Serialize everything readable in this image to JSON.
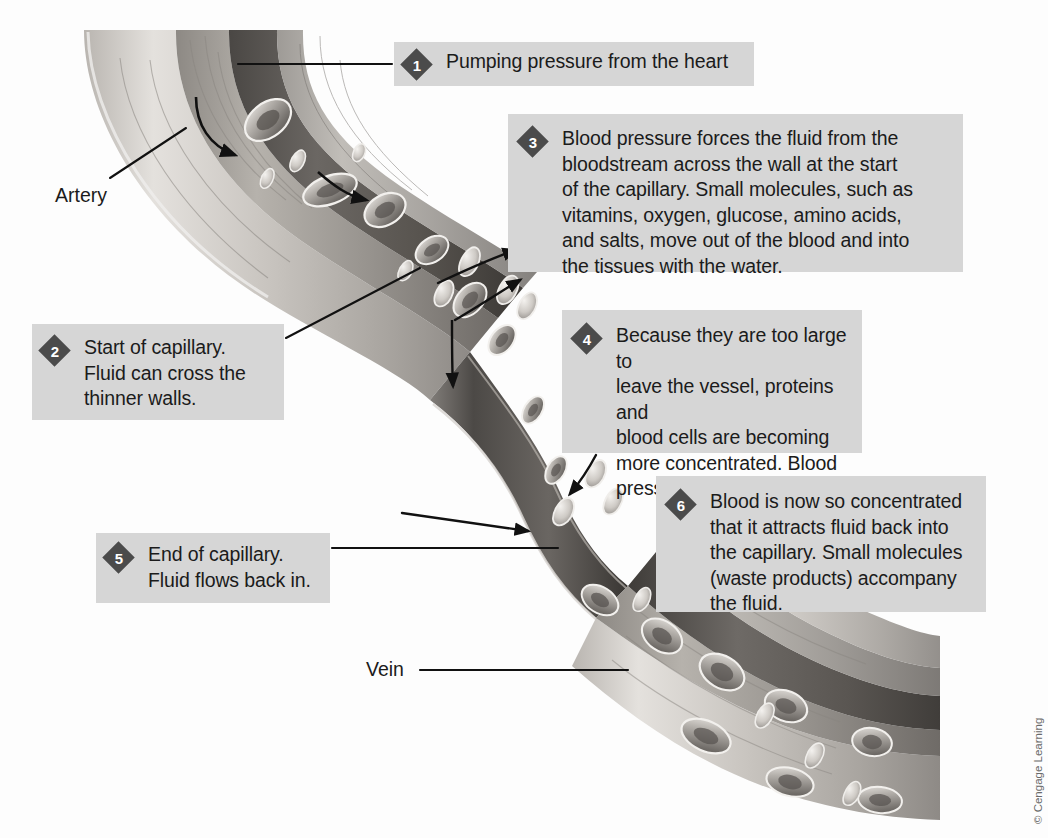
{
  "figure": {
    "copyright": "© Cengage Learning"
  },
  "labels": {
    "artery": "Artery",
    "vein": "Vein"
  },
  "callouts": [
    {
      "number": "1",
      "text": "Pumping pressure from the heart"
    },
    {
      "number": "2",
      "text": "Start of capillary.\nFluid can cross the\nthinner walls."
    },
    {
      "number": "3",
      "text": "Blood pressure forces the fluid from the\nbloodstream across the wall at the start\nof the capillary. Small molecules, such as\nvitamins, oxygen, glucose, amino acids,\nand salts, move out of the blood and into\nthe tissues with the water."
    },
    {
      "number": "4",
      "text": "Because they are too large to\nleave the vessel, proteins and\nblood cells are becoming\nmore concentrated. Blood\npressure is decreasing."
    },
    {
      "number": "5",
      "text": "End of capillary.\nFluid flows back in."
    },
    {
      "number": "6",
      "text": "Blood is now so concentrated\nthat it attracts fluid back into\nthe capillary. Small molecules\n(waste products) accompany\nthe fluid."
    }
  ],
  "colors": {
    "callout_background": "#d6d6d6",
    "badge": "#4b4b4b",
    "badge_text": "#ffffff",
    "text": "#1b1b1b",
    "page_background": "#fdfdfd",
    "vessel_wall_light": "#cfcdc9",
    "vessel_wall_mid": "#a8a49f",
    "vessel_lumen_dark": "#5d5a57",
    "leader_line": "#111111"
  }
}
